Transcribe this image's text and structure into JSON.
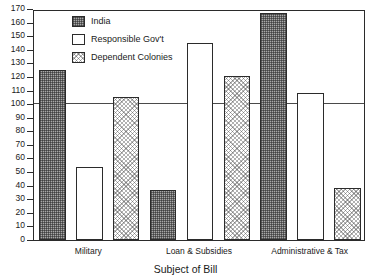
{
  "chart_data": {
    "type": "bar",
    "title": "",
    "xlabel": "Subject of Bill",
    "ylabel": "",
    "categories": [
      "Military",
      "Loan & Subsidies",
      "Administrative & Tax"
    ],
    "series": [
      {
        "name": "India",
        "values": [
          125,
          37,
          167
        ]
      },
      {
        "name": "Responsible Gov't",
        "values": [
          54,
          145,
          108
        ]
      },
      {
        "name": "Dependent Colonies",
        "values": [
          105,
          121,
          38
        ]
      }
    ],
    "ylim": [
      0,
      170
    ],
    "ytick_step": 10,
    "yticks": [
      0,
      10,
      20,
      30,
      40,
      50,
      60,
      70,
      80,
      90,
      100,
      110,
      120,
      130,
      140,
      150,
      160,
      170
    ],
    "ytick_labels": [
      "0",
      "10",
      "20",
      "30",
      "40",
      "50",
      "60",
      "70",
      "80",
      "90",
      "100",
      "110",
      "120",
      "130",
      "140",
      "150",
      "160",
      "170"
    ],
    "grid": false,
    "reference_line": {
      "value": 100,
      "label": ""
    },
    "legend_position": "top-left",
    "series_patterns": [
      "cross-hatch-dark",
      "solid-white",
      "dotted-light"
    ],
    "colors": {
      "india_fill": "#a8a8a8",
      "responsible_fill": "#ffffff",
      "dependent_fill": "#ffffff",
      "outline": "#2b2b2b",
      "reference_line": "#4a4a4a",
      "background": "#ffffff",
      "text": "#1a1a1a"
    }
  },
  "legend": {
    "entries": [
      {
        "label": "India"
      },
      {
        "label": "Responsible Gov't"
      },
      {
        "label": "Dependent Colonies"
      }
    ]
  },
  "axes": {
    "x_title": "Subject of Bill"
  }
}
